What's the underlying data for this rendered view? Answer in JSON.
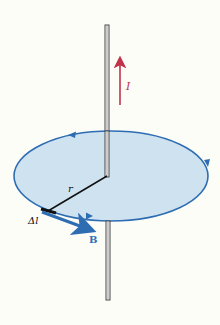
{
  "diagram": {
    "labels": {
      "current": "I",
      "radius": "r",
      "segment": "Δl",
      "field": "B"
    },
    "colors": {
      "background": "#fdfdf8",
      "disk_fill": "#cfe2f0",
      "loop_stroke": "#2f6db3",
      "field_vector": "#2f6db3",
      "current_arrow": "#c0334b",
      "wire": "#555555",
      "radius_line": "#111111"
    },
    "elements": {
      "wire": {
        "x": 107,
        "top": 25,
        "bottom": 300
      },
      "loop": {
        "cx": 111,
        "cy": 176,
        "rx": 97,
        "ry": 45
      },
      "current_arrow": {
        "x": 120,
        "y_start": 105,
        "y_end": 58
      },
      "radius": {
        "x1": 107,
        "y1": 176,
        "x2": 48,
        "y2": 211
      },
      "field_vector": {
        "x1": 42,
        "y1": 212,
        "x2": 92,
        "y2": 231
      }
    }
  }
}
